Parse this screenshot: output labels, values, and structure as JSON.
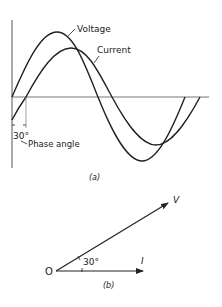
{
  "figure_a": {
    "caption": "(a)",
    "curves": [
      {
        "name": "Voltage",
        "label": "Voltage",
        "amplitude": 65,
        "phase_deg": 0
      },
      {
        "name": "Current",
        "label": "Current",
        "amplitude": 48,
        "phase_deg": -30
      }
    ],
    "phase_angle_value": "30°",
    "phase_angle_label": "Phase angle"
  },
  "figure_b": {
    "caption": "(b)",
    "origin_label": "O",
    "vectors": [
      {
        "name": "V",
        "label": "V",
        "angle_deg": 30
      },
      {
        "name": "I",
        "label": "I",
        "angle_deg": 0
      }
    ],
    "angle_label": "30°"
  },
  "colors": {
    "ink": "#222222",
    "axis": "#555555",
    "background": "#ffffff"
  }
}
